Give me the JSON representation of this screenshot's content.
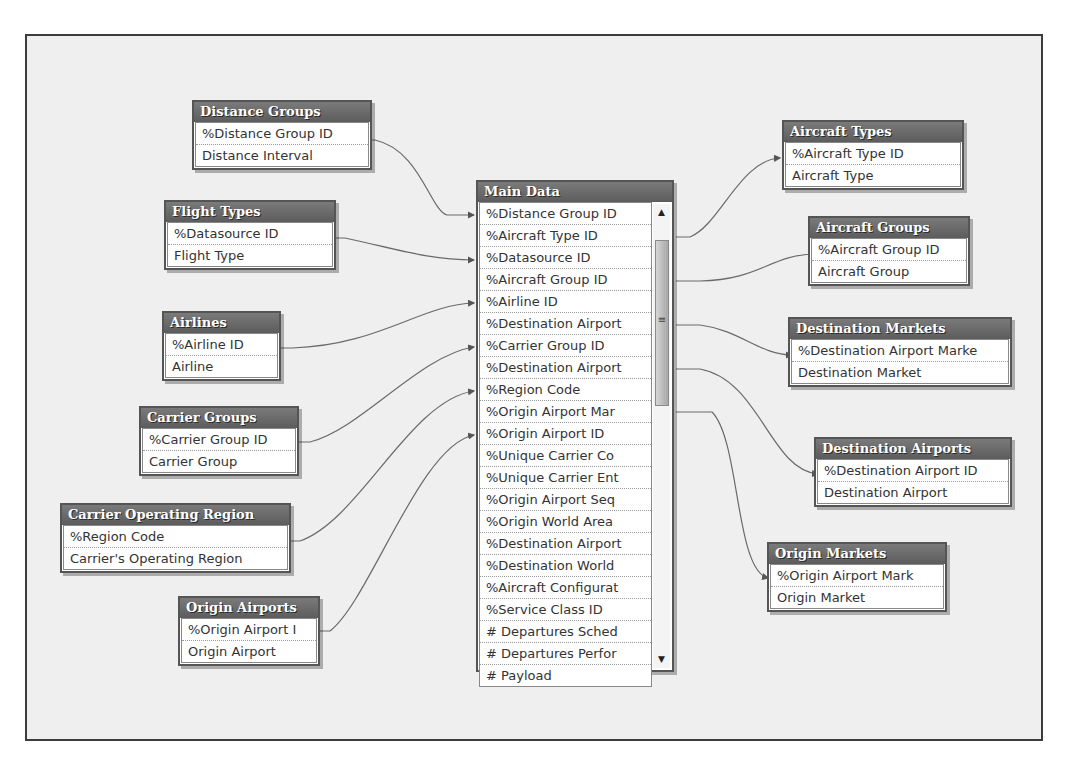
{
  "tables": {
    "distance_groups": {
      "title": "Distance Groups",
      "fields": [
        "%Distance Group ID",
        "Distance Interval"
      ]
    },
    "flight_types": {
      "title": "Flight Types",
      "fields": [
        "%Datasource ID",
        "Flight Type"
      ]
    },
    "airlines": {
      "title": "Airlines",
      "fields": [
        "%Airline ID",
        "Airline"
      ]
    },
    "carrier_groups": {
      "title": "Carrier Groups",
      "fields": [
        "%Carrier Group ID",
        "Carrier Group"
      ]
    },
    "carrier_operating_region": {
      "title": "Carrier Operating Region",
      "fields": [
        "%Region Code",
        "Carrier's Operating Region"
      ]
    },
    "origin_airports": {
      "title": "Origin Airports",
      "fields": [
        "%Origin Airport I",
        "Origin Airport"
      ]
    },
    "main_data": {
      "title": "Main Data",
      "fields": [
        "%Distance Group ID",
        "%Aircraft Type ID",
        "%Datasource ID",
        "%Aircraft Group ID",
        "%Airline ID",
        "%Destination Airport",
        "%Carrier Group ID",
        "%Destination Airport",
        "%Region Code",
        "%Origin Airport Mar",
        "%Origin Airport ID",
        "%Unique Carrier Co",
        "%Unique Carrier Ent",
        "%Origin Airport Seq",
        "%Origin World Area",
        "%Destination Airport",
        "%Destination World",
        "%Aircraft Configurat",
        "%Service Class ID",
        "# Departures Sched",
        "# Departures Perfor",
        "# Payload"
      ],
      "scroll_up_glyph": "▲",
      "scroll_down_glyph": "▼",
      "scroll_grip_glyph": "≡"
    },
    "aircraft_types": {
      "title": "Aircraft Types",
      "fields": [
        "%Aircraft Type ID",
        "Aircraft Type"
      ]
    },
    "aircraft_groups": {
      "title": "Aircraft Groups",
      "fields": [
        "%Aircraft Group ID",
        "Aircraft Group"
      ]
    },
    "destination_markets": {
      "title": "Destination Markets",
      "fields": [
        "%Destination Airport Marke",
        "Destination Market"
      ]
    },
    "destination_airports": {
      "title": "Destination Airports",
      "fields": [
        "%Destination Airport ID",
        "Destination Airport"
      ]
    },
    "origin_markets": {
      "title": "Origin Markets",
      "fields": [
        "%Origin Airport Mark",
        "Origin Market"
      ]
    }
  },
  "colors": {
    "header_bg": "#666666",
    "header_text": "#ffffff",
    "canvas_bg": "#efefef",
    "wire": "#555555"
  }
}
